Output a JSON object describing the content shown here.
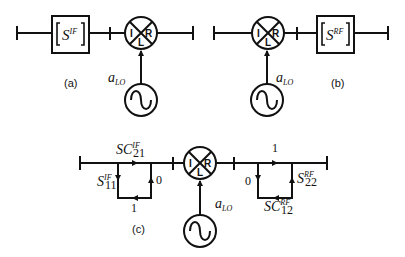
{
  "figure": {
    "subfigures": [
      {
        "id": "a",
        "caption": "(a)",
        "block_label": "S",
        "block_superscript": "IF",
        "mixer_ports": {
          "left": "I",
          "right": "R",
          "bottom": "L"
        },
        "lo_label": "a",
        "lo_subscript": "LO"
      },
      {
        "id": "b",
        "caption": "(b)",
        "block_label": "S",
        "block_superscript": "RF",
        "mixer_ports": {
          "left": "I",
          "right": "R",
          "bottom": "L"
        },
        "lo_label": "a",
        "lo_subscript": "LO"
      },
      {
        "id": "c",
        "caption": "(c)",
        "mixer_ports": {
          "left": "I",
          "right": "R",
          "bottom": "L"
        },
        "lo_label": "a",
        "lo_subscript": "LO",
        "left_graph": {
          "top_label": "SC",
          "top_sub": "21",
          "top_sup": "IF",
          "left_label": "S",
          "left_sub": "11",
          "left_sup": "IF",
          "right_value": "0",
          "bottom_value": "1"
        },
        "right_graph": {
          "top_value": "1",
          "left_value": "0",
          "right_label": "S",
          "right_sub": "22",
          "right_sup": "RF",
          "bottom_label": "SC",
          "bottom_sub": "12",
          "bottom_sup": "RF"
        }
      }
    ]
  }
}
